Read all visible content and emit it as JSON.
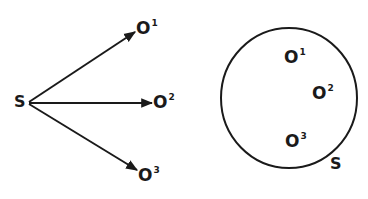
{
  "colors": {
    "background": "#ffffff",
    "ink": "#1a1a1a"
  },
  "left_diagram": {
    "source": {
      "label": "S"
    },
    "targets": [
      {
        "base": "O",
        "sup": "1"
      },
      {
        "base": "O",
        "sup": "2"
      },
      {
        "base": "O",
        "sup": "3"
      }
    ],
    "edges": [
      {
        "from": "S",
        "to": "O1"
      },
      {
        "from": "S",
        "to": "O2"
      },
      {
        "from": "S",
        "to": "O3"
      }
    ]
  },
  "right_diagram": {
    "set_label": "S",
    "members": [
      {
        "base": "O",
        "sup": "1"
      },
      {
        "base": "O",
        "sup": "2"
      },
      {
        "base": "O",
        "sup": "3"
      }
    ]
  }
}
